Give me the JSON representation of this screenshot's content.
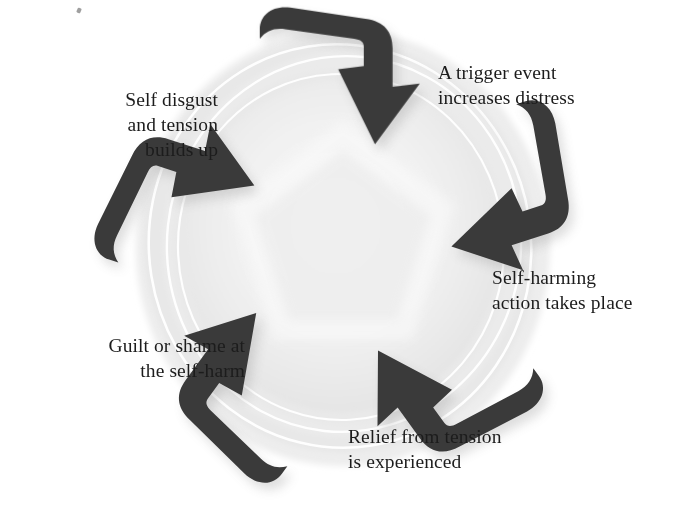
{
  "diagram": {
    "shape": "pentagonal-cycle",
    "direction": "clockwise",
    "arrow_count": 5,
    "colors": {
      "arrow_fill": "#3a3a3a",
      "arrow_shadow": "#b9b9b9",
      "ring_outer": "#e6e6e6",
      "ring_mid": "#ebebeb",
      "ring_inner": "#f0f0f0",
      "ring_line": "#ffffff",
      "center": "#f4f4f4",
      "page_background": "#ffffff",
      "text": "#1c1c1c"
    }
  },
  "labels": {
    "trigger": "A trigger event\nincreases distress",
    "selfharm": "Self-harming\naction takes place",
    "relief": "Relief from tension\nis experienced",
    "guilt": "Guilt or shame at\nthe self-harm",
    "disgust": "Self disgust\nand tension\nbuilds up"
  },
  "stages": [
    {
      "order": 1,
      "position": "top-right",
      "text": "A trigger event increases distress"
    },
    {
      "order": 2,
      "position": "right",
      "text": "Self-harming action takes place"
    },
    {
      "order": 3,
      "position": "bottom",
      "text": "Relief from tension is experienced"
    },
    {
      "order": 4,
      "position": "bottom-left",
      "text": "Guilt or shame at the self-harm"
    },
    {
      "order": 5,
      "position": "top-left",
      "text": "Self disgust and tension builds up"
    }
  ]
}
